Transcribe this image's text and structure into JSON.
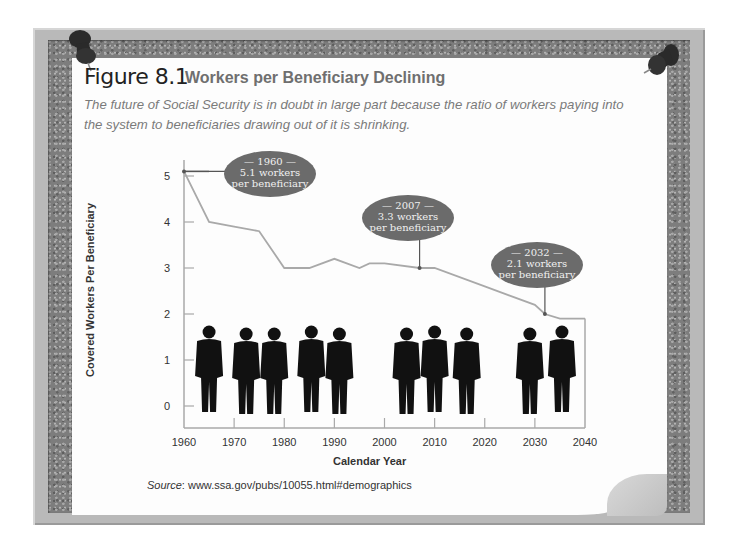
{
  "figure": {
    "label": "Figure 8.1",
    "title": "Workers per Beneficiary Declining",
    "caption": "The future of Social Security is in doubt in large part because the ratio of workers paying into the system to beneficiaries drawing out of it is shrinking.",
    "source_label": "Source",
    "source_text": ": www.ssa.gov/pubs/10055.html#demographics"
  },
  "colors": {
    "line": "#a9a9a9",
    "axis": "#a9a9a9",
    "callout": "#6b6b6b",
    "callout_text": "#f0f0f0",
    "silhouette": "#111111"
  },
  "chart_data": {
    "type": "line",
    "title": "Workers per Beneficiary Declining",
    "xlabel": "Calendar Year",
    "ylabel": "Covered Workers Per Beneficiary",
    "xlim": [
      1960,
      2040
    ],
    "ylim": [
      0,
      5.2
    ],
    "x_ticks": [
      1960,
      1970,
      1980,
      1990,
      2000,
      2010,
      2020,
      2030,
      2040
    ],
    "y_ticks": [
      0,
      1,
      2,
      3,
      4,
      5
    ],
    "grid": false,
    "legend": null,
    "series": [
      {
        "name": "Covered Workers Per Beneficiary",
        "x": [
          1960,
          1965,
          1970,
          1975,
          1980,
          1985,
          1990,
          1995,
          1997,
          2000,
          2007,
          2010,
          2020,
          2030,
          2032,
          2035,
          2040
        ],
        "values": [
          5.1,
          4.0,
          3.9,
          3.8,
          3.0,
          3.0,
          3.2,
          3.0,
          3.1,
          3.1,
          3.0,
          3.0,
          2.6,
          2.2,
          2.0,
          1.9,
          1.9
        ]
      }
    ],
    "annotations": [
      {
        "year_label": "— 1960 —",
        "line1": "5.1 workers",
        "line2": "per beneficiary",
        "x": 1960,
        "y": 5.1
      },
      {
        "year_label": "— 2007 —",
        "line1": "3.3 workers",
        "line2": "per beneficiary",
        "x": 2007,
        "y": 3.0
      },
      {
        "year_label": "— 2032 —",
        "line1": "2.1 workers",
        "line2": "per beneficiary",
        "x": 2032,
        "y": 2.0
      }
    ],
    "decoration": "Row of 12 black business-people silhouettes standing along the bottom of the plot area"
  }
}
